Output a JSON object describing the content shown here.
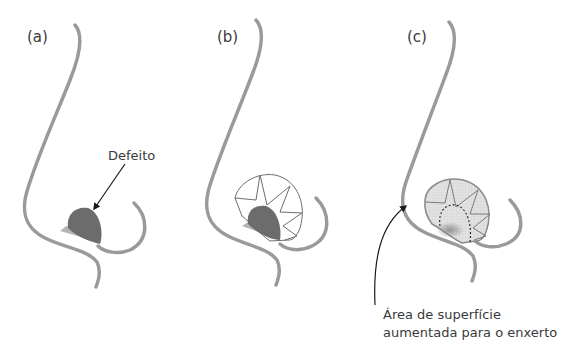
{
  "panels": [
    {
      "id": "a",
      "label": "(a)"
    },
    {
      "id": "b",
      "label": "(b)"
    },
    {
      "id": "c",
      "label": "(c)"
    }
  ],
  "annotations": {
    "defect": "Defeito",
    "graft_area_line1": "Área de superfície",
    "graft_area_line2": "aumentada para o enxerto"
  },
  "colors": {
    "nose_outline": "#9a9a9a",
    "defect_fill": "#6f6f6f",
    "defect_base": "#b8b8b8",
    "graft_fill": "#dedede",
    "graft_lines": "#7a7a7a",
    "arrow": "#1a1a1a",
    "text": "#3a3a3a"
  }
}
